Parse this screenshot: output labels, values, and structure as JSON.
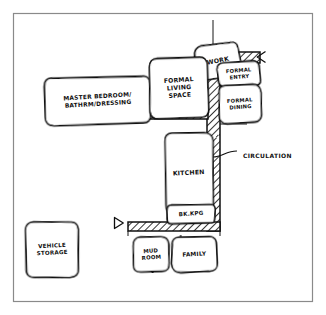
{
  "frame": {
    "border_color": "#8a8a8a",
    "background": "#ffffff",
    "ink_color": "#111111"
  },
  "diagram": {
    "type": "architectural-bubble-diagram",
    "title": "",
    "hatch_color": "#111111"
  },
  "rooms": [
    {
      "id": "work",
      "name": "work-room",
      "lines": [
        "WORK"
      ],
      "label": "WORK",
      "x": 196,
      "y": 44,
      "w": 44,
      "h": 34,
      "rotate": -9,
      "font_size": 6.2,
      "line_gap": 7
    },
    {
      "id": "master-suite",
      "name": "master-suite-room",
      "lines": [
        "MASTER BEDROOM/",
        "BATHRM/DRESSING"
      ],
      "label": "MASTER BEDROOM/ BATHRM/DRESSING",
      "x": 45,
      "y": 77,
      "w": 105,
      "h": 47,
      "rotate": -1.5,
      "font_size": 5.9,
      "line_gap": 7.5
    },
    {
      "id": "formal-living",
      "name": "formal-living-space-room",
      "lines": [
        "FORMAL",
        "LIVING",
        "SPACE"
      ],
      "label": "FORMAL LIVING SPACE",
      "x": 150,
      "y": 58,
      "w": 58,
      "h": 60,
      "rotate": -2,
      "font_size": 6.1,
      "line_gap": 7.6
    },
    {
      "id": "formal-entry",
      "name": "formal-entry-room",
      "lines": [
        "FORMAL",
        "ENTRY"
      ],
      "label": "FORMAL ENTRY",
      "x": 218,
      "y": 62,
      "w": 42,
      "h": 24,
      "rotate": -3,
      "font_size": 5.2,
      "line_gap": 6.4
    },
    {
      "id": "formal-dining",
      "name": "formal-dining-room",
      "lines": [
        "FORMAL",
        "DINING"
      ],
      "label": "FORMAL DINING",
      "x": 219,
      "y": 85,
      "w": 42,
      "h": 38,
      "rotate": -2,
      "font_size": 5.2,
      "line_gap": 6.6
    },
    {
      "id": "kitchen",
      "name": "kitchen-room",
      "lines": [
        "KITCHEN"
      ],
      "label": "KITCHEN",
      "x": 165,
      "y": 133,
      "w": 48,
      "h": 80,
      "rotate": -1,
      "font_size": 6.2,
      "line_gap": 7
    },
    {
      "id": "bkkpg",
      "name": "bookkeeping-room",
      "lines": [
        "BK.KPG"
      ],
      "label": "BK.KPG",
      "x": 167,
      "y": 205,
      "w": 48,
      "h": 18,
      "rotate": -1,
      "font_size": 5.6,
      "line_gap": 6.5
    },
    {
      "id": "mud-room",
      "name": "mud-room",
      "lines": [
        "MUD",
        "ROOM"
      ],
      "label": "MUD ROOM",
      "x": 133,
      "y": 237,
      "w": 36,
      "h": 35,
      "rotate": -2,
      "font_size": 5.4,
      "line_gap": 6.6
    },
    {
      "id": "family",
      "name": "family-room",
      "lines": [
        "FAMILY"
      ],
      "label": "FAMILY",
      "x": 172,
      "y": 237,
      "w": 45,
      "h": 35,
      "rotate": -1,
      "font_size": 5.8,
      "line_gap": 6.8
    },
    {
      "id": "vehicle-storage",
      "name": "vehicle-storage-room",
      "lines": [
        "VEHICLE",
        "STORAGE"
      ],
      "label": "VEHICLE STORAGE",
      "x": 26,
      "y": 222,
      "w": 52,
      "h": 55,
      "rotate": -1,
      "font_size": 5.6,
      "line_gap": 7
    }
  ],
  "annotations": [
    {
      "id": "circulation",
      "name": "circulation-callout",
      "label": "CIRCULATION",
      "x": 243,
      "y": 156,
      "font_size": 6.0
    }
  ],
  "entry_markers": [
    {
      "id": "entry-right",
      "name": "entry-arrow-right",
      "x": 260,
      "y": 57,
      "dir": "left"
    },
    {
      "id": "entry-bottom",
      "name": "entry-arrow-bottom",
      "x": 120,
      "y": 223,
      "dir": "right"
    }
  ],
  "circulation_spine": {
    "name": "circulation-spine",
    "vertical": {
      "x": 207,
      "y": 52,
      "w": 13,
      "h": 179
    },
    "top_band": {
      "x": 207,
      "y": 52,
      "w": 53,
      "h": 11
    },
    "mid_band": {
      "x": 141,
      "y": 110,
      "w": 66,
      "h": 9
    },
    "bottom_band": {
      "x": 128,
      "y": 222,
      "w": 92,
      "h": 9
    }
  }
}
